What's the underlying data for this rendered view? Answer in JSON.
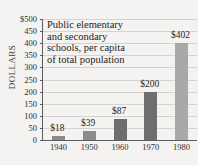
{
  "chart_data": {
    "type": "bar",
    "title_lines": [
      "Public elementary",
      "and secondary",
      "schools, per capita",
      "of total population"
    ],
    "xlabel": "",
    "ylabel": "DOLLARS",
    "categories": [
      "1940",
      "1950",
      "1960",
      "1970",
      "1980"
    ],
    "values": [
      18,
      39,
      87,
      200,
      402
    ],
    "data_labels": [
      "$18",
      "$39",
      "$87",
      "$200",
      "$402"
    ],
    "ylim": [
      0,
      500
    ],
    "ytick_values": [
      0,
      50,
      100,
      150,
      200,
      250,
      300,
      350,
      400,
      450,
      500
    ],
    "ytick_labels": [
      "0",
      "50",
      "100",
      "150",
      "200",
      "250",
      "300",
      "350",
      "400",
      "450",
      "$500"
    ],
    "grid": true,
    "legend": "none",
    "bar_colors": [
      "#8c8c8c",
      "#8c8c8c",
      "#6e6e6e",
      "#6e6e6e",
      "#a8a8a8"
    ],
    "colors": {
      "background": "#f4f3f1",
      "axis": "#5d5d5d",
      "gridline": "#d5d3d0",
      "text": "#232323",
      "bar_dark": "#6e6e6e",
      "bar_mid": "#8c8c8c",
      "bar_light": "#a8a8a8"
    }
  }
}
